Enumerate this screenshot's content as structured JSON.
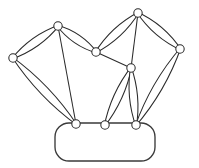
{
  "figure": {
    "title": "Parallel kinematic linkage mechanism",
    "stroke_color": "#2b2b2b",
    "fill_color": "#ffffff",
    "background_color": "#ffffff",
    "width": 199,
    "height": 168,
    "joints": [
      {
        "id": "J1",
        "name": "left-outer-joint",
        "x": 13,
        "y": 58,
        "r": 4.2
      },
      {
        "id": "J2",
        "name": "left-upper-joint",
        "x": 58,
        "y": 26,
        "r": 4.2
      },
      {
        "id": "J3",
        "name": "center-upper-joint",
        "x": 96,
        "y": 52,
        "r": 4.2
      },
      {
        "id": "J4",
        "name": "right-top-joint",
        "x": 138,
        "y": 13,
        "r": 4.2
      },
      {
        "id": "J5",
        "name": "right-outer-joint",
        "x": 180,
        "y": 49,
        "r": 4.2
      },
      {
        "id": "J6",
        "name": "center-lower-joint",
        "x": 131,
        "y": 68,
        "r": 4.2
      },
      {
        "id": "J7",
        "name": "base-left-joint",
        "x": 76,
        "y": 124,
        "r": 4.2
      },
      {
        "id": "J8",
        "name": "base-center-joint",
        "x": 105,
        "y": 125,
        "r": 4.2
      },
      {
        "id": "J9",
        "name": "base-right-joint",
        "x": 136,
        "y": 125,
        "r": 4.2
      }
    ],
    "links": [
      {
        "id": "L1",
        "name": "link-left-upper-outer",
        "from": "J1",
        "to": "J2",
        "half_width": 6.5
      },
      {
        "id": "L2",
        "name": "link-left-upper-inner",
        "from": "J2",
        "to": "J3",
        "half_width": 6.5
      },
      {
        "id": "L3",
        "name": "link-left-lower-long",
        "from": "J1",
        "to": "J7",
        "half_width": 6.5
      },
      {
        "id": "L4",
        "name": "link-left-diagonal",
        "from": "J2",
        "to": "J7",
        "half_width": 0
      },
      {
        "id": "L5",
        "name": "link-center-diagonal",
        "from": "J3",
        "to": "J6",
        "half_width": 0
      },
      {
        "id": "L6",
        "name": "link-right-top-left",
        "from": "J3",
        "to": "J4",
        "half_width": 6.5
      },
      {
        "id": "L7",
        "name": "link-right-top-right",
        "from": "J4",
        "to": "J5",
        "half_width": 6.5
      },
      {
        "id": "L8",
        "name": "link-right-inner",
        "from": "J4",
        "to": "J6",
        "half_width": 0
      },
      {
        "id": "L9",
        "name": "link-right-lower-long",
        "from": "J5",
        "to": "J9",
        "half_width": 6.5
      },
      {
        "id": "L10",
        "name": "link-center-left-lower",
        "from": "J6",
        "to": "J8",
        "half_width": 6.0
      },
      {
        "id": "L11",
        "name": "link-center-right-lower",
        "from": "J6",
        "to": "J9",
        "half_width": 6.0
      }
    ],
    "platform": {
      "name": "base-platform",
      "x": 55,
      "y": 123,
      "width": 100,
      "height": 38,
      "corner_radius": 14
    }
  }
}
